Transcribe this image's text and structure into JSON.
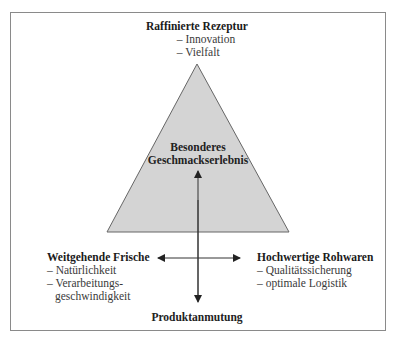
{
  "diagram": {
    "top": {
      "title": "Raffinierte Rezeptur",
      "items": [
        "– Innovation",
        "– Vielfalt"
      ]
    },
    "center": {
      "line1": "Besonderes",
      "line2": "Geschmackserlebnis"
    },
    "left": {
      "title": "Weitgehende Frische",
      "items": [
        "– Natürlichkeit",
        "– Verarbeitungs-"
      ],
      "continuation": "geschwindigkeit"
    },
    "right": {
      "title": "Hochwertige Rohwaren",
      "items": [
        "– Qualitätssicherung",
        "– optimale Logistik"
      ]
    },
    "bottom": {
      "title": "Produktanmutung"
    },
    "colors": {
      "triangle_fill": "#d4d4d4",
      "triangle_stroke": "#666666",
      "arrow": "#222222",
      "frame": "#8a8a8a"
    }
  }
}
